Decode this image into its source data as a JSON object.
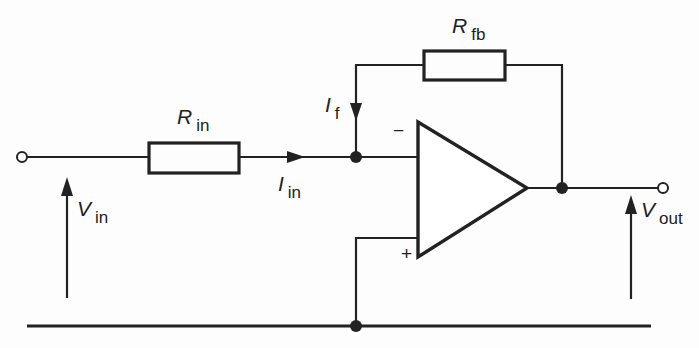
{
  "diagram": {
    "type": "inverting-op-amp-circuit",
    "components": {
      "r_in": {
        "symbol": "R",
        "subscript": "in"
      },
      "r_fb": {
        "symbol": "R",
        "subscript": "fb"
      },
      "op_amp": {
        "inverting_sign": "−",
        "noninverting_sign": "+"
      }
    },
    "currents": {
      "i_in": {
        "symbol": "I",
        "subscript": "in"
      },
      "i_f": {
        "symbol": "I",
        "subscript": "f"
      }
    },
    "voltages": {
      "v_in": {
        "symbol": "V",
        "subscript": "in"
      },
      "v_out": {
        "symbol": "V",
        "subscript": "out"
      }
    },
    "colors": {
      "line": "#222222",
      "background": "#fdfdfd"
    }
  }
}
